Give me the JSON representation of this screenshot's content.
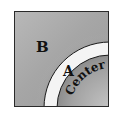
{
  "diagram": {
    "labels": {
      "outer_region": "B",
      "ring_region": "A",
      "core_region": "Center"
    },
    "colors": {
      "outer_region": "#a8a8a8",
      "ring_region": "#f2f2f2",
      "core_region": "#9c9c9c",
      "outline": "#1a1a1a"
    }
  }
}
